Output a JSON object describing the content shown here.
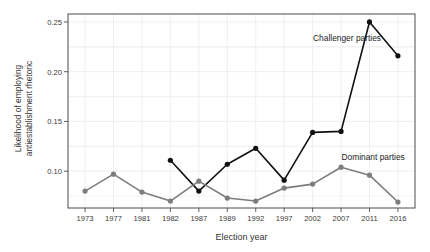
{
  "chart_data": {
    "type": "line",
    "title": "",
    "xlabel": "Election year",
    "ylabel": "Likelihood of employing antiestablishment rhetoric",
    "ylabel_line1": "Likelihood of employing",
    "ylabel_line2": "antiestablishment rhetoric",
    "categories": [
      "1973",
      "1977",
      "1981",
      "1982",
      "1987",
      "1989",
      "1992",
      "1997",
      "2002",
      "2007",
      "2011",
      "2016"
    ],
    "yticks": [
      "0.10",
      "0.15",
      "0.20",
      "0.25"
    ],
    "ytick_values": [
      0.1,
      0.15,
      0.2,
      0.25
    ],
    "ylim": [
      0.063,
      0.258
    ],
    "grid": true,
    "legend_position": "inline-annotations",
    "series": [
      {
        "name": "Challenger parties",
        "color": "#111111",
        "values": [
          null,
          null,
          null,
          0.111,
          0.08,
          0.107,
          0.123,
          0.091,
          0.139,
          0.14,
          0.25,
          0.216
        ],
        "annotation": "Challenger parties",
        "annotation_x": "2007",
        "annotation_y": 0.233
      },
      {
        "name": "Dominant parties",
        "color": "#7d7d7d",
        "values": [
          0.08,
          0.097,
          0.079,
          0.07,
          0.09,
          0.073,
          0.07,
          0.083,
          0.087,
          0.104,
          0.096,
          0.069
        ],
        "annotation": "Dominant parties",
        "annotation_x": "2011",
        "annotation_y": 0.113
      }
    ]
  },
  "colors": {
    "challenger": "#111111",
    "dominant": "#7d7d7d",
    "panel_border": "#4d4d4d",
    "grid": "#ededed",
    "axis_text": "#3a3a3a",
    "background": "#ffffff"
  }
}
